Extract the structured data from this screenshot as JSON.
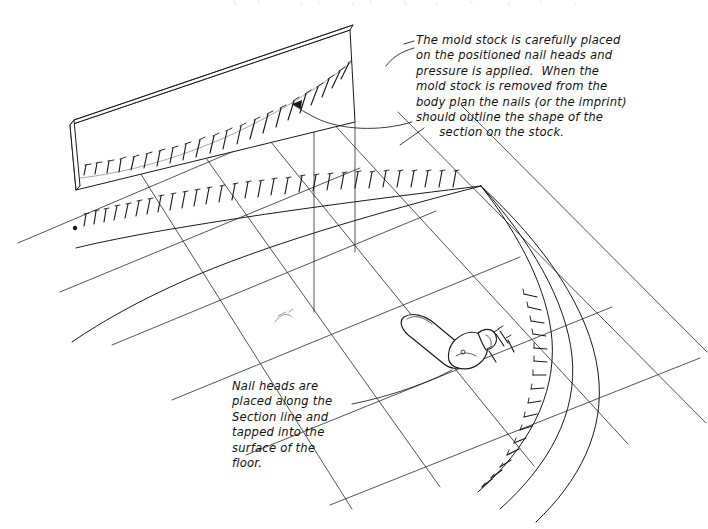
{
  "document": {
    "kind": "hand-drawn technical illustration",
    "subject": "Lofting a hull section onto a mold stock using nail heads",
    "medium": "ink line drawing on white paper",
    "ink_color": "#1a1a1a",
    "paper_color": "#ffffff",
    "width": 708,
    "height": 529
  },
  "annotations": {
    "mold_stock_note": {
      "text": "The mold stock is carefully placed\non the positioned nail heads and\npressure is applied.  When the\nmold stock is removed from the\nbody plan the nails (or the imprint)\nshould outline the shape of the\n      section on the stock.",
      "leader": "curved-leader-with-arrowhead"
    },
    "nail_heads_note": {
      "text": "Nail heads are\nplaced along the\nSection line and\ntapped into the\nsurface of the\nfloor.",
      "leader": "straight-leader-to-hammer-area"
    }
  },
  "scene": {
    "mold_stock_board": {
      "label": "mold stock",
      "description": "thin rectangular board standing on edge in perspective, nail impressions tracing a curve across its face"
    },
    "lofting_floor": {
      "label": "body plan floor grid",
      "description": "perspective lattice of two line families drawn on the loft floor"
    },
    "section_curves": {
      "label": "body plan section lines",
      "count": 3,
      "description": "three nested curves fanning from a convergence point"
    },
    "nail_line": {
      "label": "nail heads along section line",
      "description": "row of upright nails tapped into the floor along the section curve"
    },
    "hammer": {
      "label": "claw hammer",
      "description": "claw hammer lying on the floor, head toward the right"
    },
    "loose_nails": {
      "label": "loose nails",
      "description": "scattered nails beside the hammer head"
    }
  }
}
